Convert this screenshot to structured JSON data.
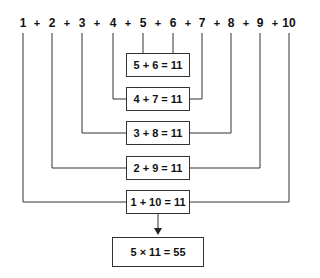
{
  "numbers": [
    "1",
    "2",
    "3",
    "4",
    "5",
    "6",
    "7",
    "8",
    "9",
    "10"
  ],
  "operator": "+",
  "pairs": [
    {
      "label": "5 + 6 = 11"
    },
    {
      "label": "4 + 7 = 11"
    },
    {
      "label": "3 + 8 = 11"
    },
    {
      "label": "2 + 9 = 11"
    },
    {
      "label": "1 + 10 = 11"
    }
  ],
  "result": {
    "label": "5 × 11 = 55"
  },
  "colors": {
    "line": "#333333",
    "text": "#111111",
    "background": "#ffffff"
  }
}
